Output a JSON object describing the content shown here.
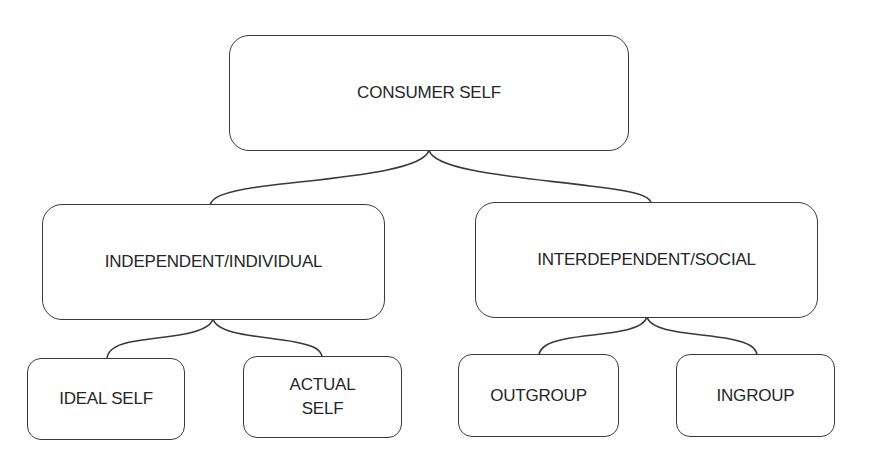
{
  "diagram": {
    "type": "hierarchy",
    "root": {
      "label": "CONSUMER SELF"
    },
    "level1": [
      {
        "label": "INDEPENDENT/INDIVIDUAL"
      },
      {
        "label": "INTERDEPENDENT/SOCIAL"
      }
    ],
    "level2": [
      {
        "label": "IDEAL SELF",
        "parent": "INDEPENDENT/INDIVIDUAL"
      },
      {
        "label": "ACTUAL\nSELF",
        "parent": "INDEPENDENT/INDIVIDUAL"
      },
      {
        "label": "OUTGROUP",
        "parent": "INTERDEPENDENT/SOCIAL"
      },
      {
        "label": "INGROUP",
        "parent": "INTERDEPENDENT/SOCIAL"
      }
    ],
    "colors": {
      "line": "#3a3a3a",
      "text": "#262626",
      "background": "#ffffff"
    }
  }
}
